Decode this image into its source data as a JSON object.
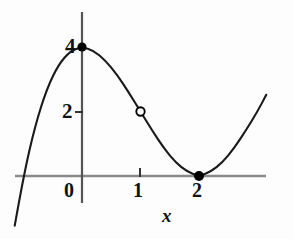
{
  "figure": {
    "title": "",
    "background_color": "#fdfdfd",
    "width": 293,
    "height": 239
  },
  "labels": {
    "y_tick_4": "4",
    "y_tick_2": "2",
    "x_tick_0": "0",
    "x_tick_1": "1",
    "x_tick_2": "2",
    "x_axis_name": "x"
  },
  "colors": {
    "curve": "#1a1a1a",
    "axis": "#8a8a8a",
    "point_fill": "#000000",
    "point_open_stroke": "#000000",
    "point_open_fill": "#ffffff",
    "text": "#111111"
  },
  "chart_data": {
    "type": "line",
    "title": "",
    "xlabel": "x",
    "ylabel": "",
    "grid": false,
    "legend": null,
    "xlim": [
      -1.15,
      3.15
    ],
    "ylim": [
      -0.95,
      5.1
    ],
    "x_ticks": [
      0,
      1,
      2
    ],
    "x_tick_labels": [
      "0",
      "1",
      "2"
    ],
    "y_ticks": [
      2,
      4
    ],
    "y_tick_labels": [
      "2",
      "4"
    ],
    "curve": {
      "name": "cubic",
      "expression": "y = (x - 2)^2 (x + 1)",
      "x": [
        -1.15,
        -1.0,
        -0.8,
        -0.6,
        -0.4,
        -0.2,
        0.0,
        0.2,
        0.4,
        0.6,
        0.8,
        1.0,
        1.2,
        1.4,
        1.6,
        1.8,
        2.0,
        2.2,
        2.4,
        2.6,
        2.8,
        3.0,
        3.15
      ],
      "y": [
        -1.54,
        0.0,
        1.57,
        2.71,
        3.46,
        3.87,
        4.0,
        3.89,
        3.58,
        3.14,
        2.59,
        2.0,
        1.41,
        0.86,
        0.42,
        0.13,
        0.0,
        0.13,
        0.42,
        0.86,
        1.41,
        2.0,
        2.52
      ]
    },
    "points": [
      {
        "name": "maximum-point",
        "x": 0,
        "y": 4,
        "style": "filled"
      },
      {
        "name": "removable-discontinuity-point",
        "x": 1,
        "y": 2,
        "style": "open"
      },
      {
        "name": "minimum-point",
        "x": 2,
        "y": 0,
        "style": "filled"
      }
    ]
  }
}
